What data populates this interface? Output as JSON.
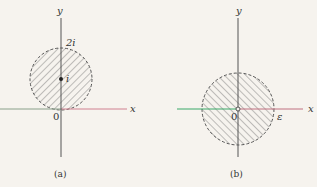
{
  "figures": [
    {
      "id": "a",
      "caption": "(a)",
      "x_label": "x",
      "y_label": "y",
      "origin_label": "0",
      "top_label": "2i",
      "center_label": "i",
      "description": "Open disk centered at i with radius 1, dashed boundary, hatched interior, tangent to the origin"
    },
    {
      "id": "b",
      "caption": "(b)",
      "x_label": "x",
      "y_label": "y",
      "origin_label": "0",
      "radius_label": "ε",
      "description": "Punctured disk of radius ε centered at the origin, dashed boundary, hatched interior, origin excluded"
    }
  ],
  "colors": {
    "background": "#f6f3ee",
    "axis": "#555555",
    "axis_left_a": "#8aa08a",
    "axis_right_a": "#d08090",
    "axis_left_b": "#3aa868",
    "axis_right_b": "#c07080",
    "hatch": "#666666"
  }
}
